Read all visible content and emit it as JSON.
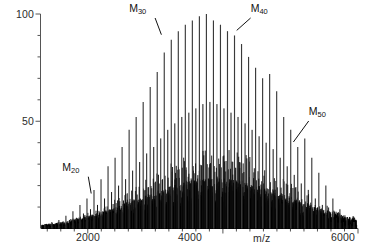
{
  "chart_data": {
    "type": "line",
    "title": "",
    "xlabel": "m/z",
    "ylabel": "",
    "xlim": [
      1300,
      6000
    ],
    "ylim": [
      0,
      100
    ],
    "grid": false,
    "legend": "none",
    "x_ticks": [
      2000,
      4000,
      6000
    ],
    "x_tick_labels": [
      "2000",
      "4000",
      "6000"
    ],
    "x_minor_tick_step": 200,
    "y_ticks": [
      50,
      100
    ],
    "y_tick_labels": [
      "50",
      "100"
    ],
    "y_minor_tick_step": 10,
    "repeat_unit_spacing_mz": 104,
    "envelope_center_mz": 3750,
    "envelope_sigma_mz": 900,
    "envelope_max_intensity": 100,
    "annotations": [
      {
        "label": "M20",
        "label_text": "M",
        "subscript": "20",
        "mz": 2080,
        "intensity": 14,
        "label_x_mz": 1770,
        "label_y_intensity": 26,
        "leader": "down-right"
      },
      {
        "label": "M30",
        "label_text": "M",
        "subscript": "30",
        "mz": 3120,
        "intensity": 88,
        "label_x_mz": 2760,
        "label_y_intensity": 100,
        "leader": "down-right"
      },
      {
        "label": "M40",
        "label_text": "M",
        "subscript": "40",
        "mz": 4160,
        "intensity": 90,
        "label_x_mz": 4470,
        "label_y_intensity": 100,
        "leader": "down-left"
      },
      {
        "label": "M50",
        "label_text": "M",
        "subscript": "50",
        "mz": 5000,
        "intensity": 38,
        "label_x_mz": 5330,
        "label_y_intensity": 52,
        "leader": "down-left"
      }
    ],
    "series": [
      {
        "name": "primary oligomer series",
        "comb_start_mz": 1364,
        "comb_spacing_mz": 104,
        "comb_count": 45,
        "peak_values_mz": [
          1364,
          1468,
          1572,
          1676,
          1780,
          1884,
          1988,
          2092,
          2196,
          2300,
          2404,
          2508,
          2612,
          2716,
          2820,
          2924,
          3028,
          3132,
          3236,
          3340,
          3444,
          3548,
          3652,
          3756,
          3860,
          3964,
          4068,
          4172,
          4276,
          4380,
          4484,
          4588,
          4692,
          4796,
          4900,
          5004,
          5108,
          5212,
          5316,
          5420,
          5524,
          5628,
          5732,
          5836,
          5940
        ],
        "peak_intensities": [
          2,
          3,
          4,
          6,
          8,
          11,
          14,
          18,
          23,
          29,
          33,
          38,
          46,
          52,
          59,
          66,
          73,
          82,
          88,
          92,
          95,
          97,
          99,
          100,
          97,
          95,
          92,
          90,
          86,
          80,
          75,
          70,
          72,
          64,
          52,
          46,
          38,
          42,
          33,
          26,
          20,
          14,
          9,
          5,
          3
        ]
      },
      {
        "name": "secondary satellite series",
        "comb_start_mz": 1416,
        "comb_spacing_mz": 104,
        "comb_count": 44,
        "peak_intensities": [
          1,
          2,
          3,
          4,
          5,
          7,
          9,
          11,
          14,
          17,
          20,
          23,
          27,
          31,
          35,
          38,
          42,
          46,
          49,
          52,
          54,
          56,
          58,
          59,
          58,
          56,
          54,
          52,
          49,
          46,
          43,
          40,
          37,
          33,
          29,
          25,
          21,
          18,
          14,
          11,
          8,
          5,
          3,
          2
        ]
      },
      {
        "name": "low-intensity fragment noise",
        "baseline_max_intensity": 22,
        "baseline_center_mz": 3900
      }
    ]
  },
  "axes": {
    "y_label_100": "100",
    "y_label_50": "50",
    "x_label_2000": "2000",
    "x_label_4000": "4000",
    "x_label_6000": "6000",
    "x_axis_title": "m/z"
  }
}
